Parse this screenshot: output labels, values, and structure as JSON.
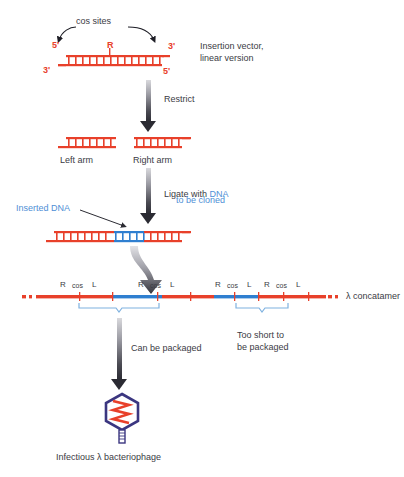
{
  "figure": {
    "colors": {
      "dna_red": "#e8402a",
      "insert_blue": "#2f7fd0",
      "label_blue": "#4f8fd6",
      "bracket_blue": "#7fb2e0",
      "text": "#3b3b44",
      "phage_head": "#3b3680",
      "arrow_dark": "#2b2b33"
    }
  },
  "step1": {
    "cos_sites_label": "cos sites",
    "r_label": "R",
    "five_prime_left": "5'",
    "three_prime_right": "3'",
    "three_prime_left": "3'",
    "five_prime_right": "5'",
    "caption_line1": "Insertion vector,",
    "caption_line2": "linear version"
  },
  "arrow1": {
    "label": "Restrict"
  },
  "step2": {
    "left_arm_label": "Left arm",
    "right_arm_label": "Right arm"
  },
  "arrow2": {
    "label_line1_a": "Ligate with ",
    "label_line1_b": "DNA",
    "label_line2": "to be cloned"
  },
  "step3": {
    "inserted_dna_label": "Inserted DNA"
  },
  "concatamer": {
    "name_label": "λ concatamer",
    "site_labels": [
      {
        "text": "R",
        "x": 60
      },
      {
        "text": "cos",
        "x": 75
      },
      {
        "text": "L",
        "x": 94
      },
      {
        "text": "R",
        "x": 138
      },
      {
        "text": "cos",
        "x": 153
      },
      {
        "text": "L",
        "x": 172
      },
      {
        "text": "R",
        "x": 215
      },
      {
        "text": "cos",
        "x": 230
      },
      {
        "text": "L",
        "x": 249
      },
      {
        "text": "R",
        "x": 264
      },
      {
        "text": "cos",
        "x": 279
      },
      {
        "text": "L",
        "x": 298
      }
    ],
    "bracket_left_label_line1": "Can be packaged",
    "bracket_right_label_line1": "Too short to",
    "bracket_right_label_line2": "be packaged"
  },
  "phage": {
    "caption_line1": "Infectious λ bacteriophage"
  }
}
